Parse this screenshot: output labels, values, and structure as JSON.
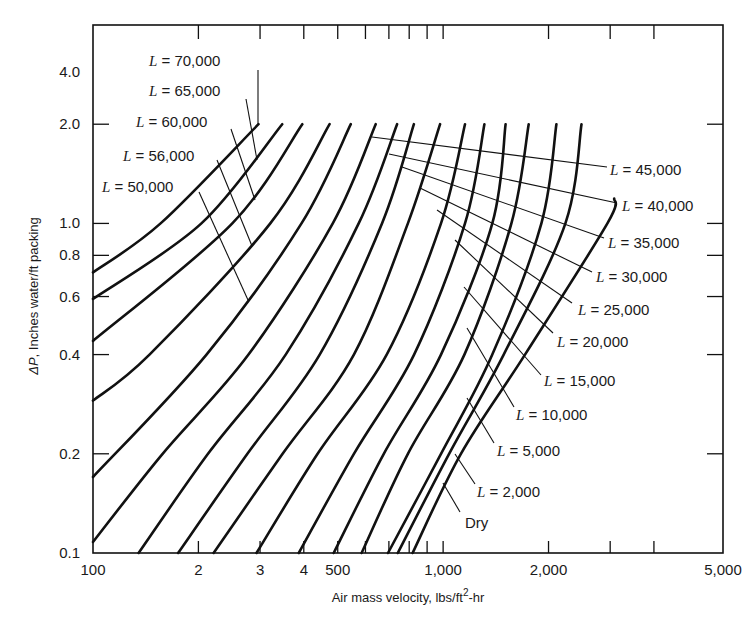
{
  "chart_data": {
    "type": "line",
    "title": "",
    "xlabel": "Air mass velocity, lbs/ft²-hr",
    "xlabel_parts": {
      "main": "Air mass velocity, lbs/ft",
      "sup": "2",
      "tail": "-hr"
    },
    "ylabel": "ΔP, Inches water/ft packing",
    "ylabel_parts": {
      "symbol": "ΔP",
      "rest": ", Inches water/ft packing"
    },
    "xscale": "log",
    "yscale": "log",
    "xlim": [
      100,
      6300
    ],
    "ylim": [
      0.1,
      4.0
    ],
    "grid": false,
    "x_ticks": [
      {
        "value": 100,
        "label": "100"
      },
      {
        "value": 200,
        "label": "2"
      },
      {
        "value": 300,
        "label": "3"
      },
      {
        "value": 400,
        "label": "4"
      },
      {
        "value": 500,
        "label": "500"
      },
      {
        "value": 600,
        "label": ""
      },
      {
        "value": 700,
        "label": ""
      },
      {
        "value": 800,
        "label": ""
      },
      {
        "value": 900,
        "label": ""
      },
      {
        "value": 1000,
        "label": "1,000"
      },
      {
        "value": 2000,
        "label": "2,000"
      },
      {
        "value": 3000,
        "label": ""
      },
      {
        "value": 4000,
        "label": ""
      },
      {
        "value": 6300,
        "label": "5,000"
      }
    ],
    "y_ticks": [
      {
        "value": 0.1,
        "label": "0.1"
      },
      {
        "value": 0.2,
        "label": "0.2"
      },
      {
        "value": 0.4,
        "label": "0.4"
      },
      {
        "value": 0.6,
        "label": "0.6"
      },
      {
        "value": 0.8,
        "label": "0.8"
      },
      {
        "value": 1.0,
        "label": "1.0"
      },
      {
        "value": 2.0,
        "label": "2.0"
      },
      {
        "value": 4.0,
        "label": "4.0"
      }
    ],
    "series": [
      {
        "name": "L = 70,000",
        "points": [
          [
            100,
            0.71
          ],
          [
            156,
            1.0
          ],
          [
            297,
            2.0
          ]
        ]
      },
      {
        "name": "L = 65,000",
        "points": [
          [
            100,
            0.59
          ],
          [
            204,
            1.0
          ],
          [
            347,
            2.0
          ]
        ]
      },
      {
        "name": "L = 60,000",
        "points": [
          [
            100,
            0.44
          ],
          [
            250,
            1.0
          ],
          [
            396,
            2.0
          ]
        ]
      },
      {
        "name": "L = 56,000",
        "points": [
          [
            100,
            0.29
          ],
          [
            145,
            0.4
          ],
          [
            321,
            1.0
          ],
          [
            474,
            2.0
          ]
        ]
      },
      {
        "name": "L = 50,000",
        "points": [
          [
            100,
            0.17
          ],
          [
            211,
            0.4
          ],
          [
            394,
            1.0
          ],
          [
            545,
            2.0
          ]
        ]
      },
      {
        "name": "L = 45,000",
        "points": [
          [
            100,
            0.108
          ],
          [
            158,
            0.2
          ],
          [
            278,
            0.4
          ],
          [
            484,
            1.0
          ],
          [
            642,
            2.0
          ]
        ]
      },
      {
        "name": "L = 40,000",
        "points": [
          [
            135,
            0.1
          ],
          [
            213,
            0.2
          ],
          [
            355,
            0.4
          ],
          [
            574,
            1.0
          ],
          [
            739,
            2.0
          ]
        ]
      },
      {
        "name": "L = 35,000",
        "points": [
          [
            175,
            0.1
          ],
          [
            276,
            0.2
          ],
          [
            444,
            0.4
          ],
          [
            669,
            1.0
          ],
          [
            825,
            2.0
          ]
        ]
      },
      {
        "name": "L = 30,000",
        "points": [
          [
            221,
            0.1
          ],
          [
            348,
            0.2
          ],
          [
            556,
            0.4
          ],
          [
            793,
            1.0
          ],
          [
            980,
            2.0
          ]
        ]
      },
      {
        "name": "L = 25,000",
        "points": [
          [
            293,
            0.1
          ],
          [
            438,
            0.2
          ],
          [
            690,
            0.4
          ],
          [
            986,
            1.0
          ],
          [
            1155,
            2.0
          ]
        ]
      },
      {
        "name": "L = 20,000",
        "points": [
          [
            387,
            0.1
          ],
          [
            556,
            0.2
          ],
          [
            826,
            0.4
          ],
          [
            1155,
            1.0
          ],
          [
            1312,
            2.0
          ]
        ]
      },
      {
        "name": "L = 15,000",
        "points": [
          [
            487,
            0.1
          ],
          [
            677,
            0.2
          ],
          [
            986,
            0.4
          ],
          [
            1382,
            1.0
          ],
          [
            1508,
            2.0
          ]
        ]
      },
      {
        "name": "L = 10,000",
        "points": [
          [
            585,
            0.1
          ],
          [
            793,
            0.2
          ],
          [
            1150,
            0.4
          ],
          [
            1567,
            1.0
          ],
          [
            1755,
            2.0
          ]
        ]
      },
      {
        "name": "L = 5,000",
        "points": [
          [
            696,
            0.1
          ],
          [
            986,
            0.2
          ],
          [
            1382,
            0.4
          ],
          [
            1908,
            1.0
          ],
          [
            2106,
            2.0
          ]
        ]
      },
      {
        "name": "L = 2,000",
        "points": [
          [
            742,
            0.1
          ],
          [
            1040,
            0.2
          ],
          [
            1489,
            0.4
          ],
          [
            2234,
            1.0
          ],
          [
            2485,
            2.0
          ]
        ]
      },
      {
        "name": "Dry",
        "points": [
          [
            818,
            0.1
          ],
          [
            1124,
            0.2
          ],
          [
            1713,
            0.4
          ],
          [
            2945,
            1.0
          ],
          [
            3080,
            1.19
          ]
        ]
      }
    ],
    "annotations": [
      {
        "series": "L = 70,000",
        "prefix": "L",
        "text": " = 70,000"
      },
      {
        "series": "L = 65,000",
        "prefix": "L",
        "text": " = 65,000"
      },
      {
        "series": "L = 60,000",
        "prefix": "L",
        "text": " = 60,000"
      },
      {
        "series": "L = 56,000",
        "prefix": "L",
        "text": " = 56,000"
      },
      {
        "series": "L = 50,000",
        "prefix": "L",
        "text": " = 50,000"
      },
      {
        "series": "L = 45,000",
        "prefix": "L",
        "text": " = 45,000"
      },
      {
        "series": "L = 40,000",
        "prefix": "L",
        "text": " = 40,000"
      },
      {
        "series": "L = 35,000",
        "prefix": "L",
        "text": " = 35,000"
      },
      {
        "series": "L = 30,000",
        "prefix": "L",
        "text": " = 30,000"
      },
      {
        "series": "L = 25,000",
        "prefix": "L",
        "text": " = 25,000"
      },
      {
        "series": "L = 20,000",
        "prefix": "L",
        "text": " = 20,000"
      },
      {
        "series": "L = 15,000",
        "prefix": "L",
        "text": " = 15,000"
      },
      {
        "series": "L = 10,000",
        "prefix": "L",
        "text": " = 10,000"
      },
      {
        "series": "L = 5,000",
        "prefix": "L",
        "text": " = 5,000"
      },
      {
        "series": "L = 2,000",
        "prefix": "L",
        "text": " = 2,000"
      },
      {
        "series": "Dry",
        "prefix": "",
        "text": "Dry"
      }
    ]
  }
}
